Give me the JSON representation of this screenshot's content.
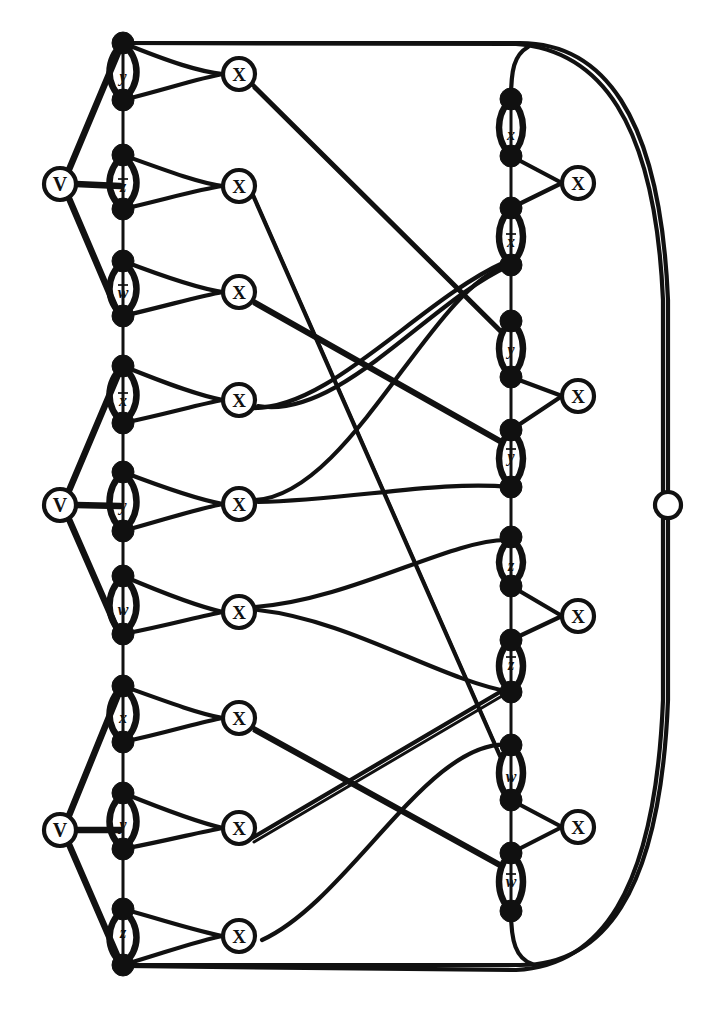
{
  "figure": {
    "type": "graph-diagram",
    "background_color": "#ffffff",
    "ink_color": "#101010"
  },
  "glyphs": {
    "clause_node_label": "X",
    "or_node_label": "V",
    "open_node_label": ""
  },
  "left_chain": {
    "name": "left-variable-chain",
    "x": 123,
    "node_count": 18,
    "node_radius": 11,
    "nodes_y": [
      43,
      100,
      155,
      209,
      261,
      316,
      366,
      423,
      472,
      531,
      576,
      634,
      686,
      742,
      793,
      849,
      909,
      965
    ],
    "edge_labels": [
      {
        "id": "L1",
        "text": "y",
        "overline": false,
        "y": 76
      },
      {
        "id": "L2",
        "text": "z",
        "overline": true,
        "y": 186
      },
      {
        "id": "L3",
        "text": "w",
        "overline": true,
        "y": 292
      },
      {
        "id": "L4",
        "text": "x",
        "overline": true,
        "y": 400
      },
      {
        "id": "L5",
        "text": "y",
        "overline": false,
        "y": 505
      },
      {
        "id": "L6",
        "text": "w",
        "overline": false,
        "y": 609
      },
      {
        "id": "L7",
        "text": "x",
        "overline": false,
        "y": 717
      },
      {
        "id": "L8",
        "text": "y",
        "overline": false,
        "y": 824
      },
      {
        "id": "L9",
        "text": "z",
        "overline": false,
        "y": 932
      }
    ]
  },
  "right_chain": {
    "name": "right-variable-chain",
    "x": 511,
    "node_count": 16,
    "node_radius": 11,
    "nodes_y": [
      99,
      156,
      208,
      265,
      321,
      377,
      430,
      487,
      537,
      586,
      640,
      692,
      745,
      800,
      853,
      911
    ],
    "edge_labels": [
      {
        "id": "R1",
        "text": "x",
        "overline": false,
        "y": 134
      },
      {
        "id": "R2",
        "text": "x",
        "overline": true,
        "y": 241
      },
      {
        "id": "R3",
        "text": "y",
        "overline": false,
        "y": 349
      },
      {
        "id": "R4",
        "text": "y",
        "overline": true,
        "y": 456
      },
      {
        "id": "R5",
        "text": "z",
        "overline": false,
        "y": 565
      },
      {
        "id": "R6",
        "text": "z",
        "overline": true,
        "y": 664
      },
      {
        "id": "R7",
        "text": "w",
        "overline": false,
        "y": 776
      },
      {
        "id": "R8",
        "text": "w",
        "overline": true,
        "y": 881
      }
    ]
  },
  "or_nodes": {
    "name": "left-or-vertices",
    "label": "V",
    "x": 60,
    "radius": 16,
    "items": [
      {
        "id": "V1",
        "y": 184
      },
      {
        "id": "V2",
        "y": 505
      },
      {
        "id": "V3",
        "y": 830
      }
    ]
  },
  "clause_nodes_left": {
    "name": "left-clause-vertices",
    "label": "X",
    "x": 239,
    "radius": 16,
    "items": [
      {
        "id": "CL1",
        "y": 74
      },
      {
        "id": "CL2",
        "y": 186
      },
      {
        "id": "CL3",
        "y": 292
      },
      {
        "id": "CL4",
        "y": 400
      },
      {
        "id": "CL5",
        "y": 504
      },
      {
        "id": "CL6",
        "y": 612
      },
      {
        "id": "CL7",
        "y": 718
      },
      {
        "id": "CL8",
        "y": 828
      },
      {
        "id": "CL9",
        "y": 936
      }
    ]
  },
  "clause_nodes_right": {
    "name": "right-clause-vertices",
    "label": "X",
    "x": 578,
    "radius": 16,
    "items": [
      {
        "id": "CR1",
        "y": 183
      },
      {
        "id": "CR2",
        "y": 396
      },
      {
        "id": "CR3",
        "y": 616
      },
      {
        "id": "CR4",
        "y": 827
      }
    ]
  },
  "open_node": {
    "name": "far-right-open-vertex",
    "x": 668,
    "y": 505,
    "radius": 13
  },
  "cross_edges": {
    "name": "crossing-clause-edges",
    "count": 8,
    "pairs": [
      {
        "from": "CL1",
        "to": "R3-region"
      },
      {
        "from": "CL2",
        "to": "R7-region"
      },
      {
        "from": "CL3",
        "to": "R4-region"
      },
      {
        "from": "CL4",
        "to": "R1-region"
      },
      {
        "from": "CL5",
        "to": "R2-region"
      },
      {
        "from": "CL6",
        "to": "R5-region"
      },
      {
        "from": "CL7",
        "to": "R8-region"
      },
      {
        "from": "CL8",
        "to": "R6-region"
      }
    ]
  },
  "frame_edges": {
    "name": "outer-wire-edges",
    "top_label": "top outer wire from left chain top node around right side to open vertex",
    "bottom_label": "bottom outer wire from left chain bottom node around right side"
  }
}
